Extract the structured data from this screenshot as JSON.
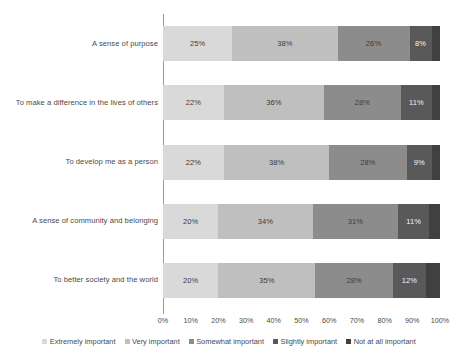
{
  "chart_data": {
    "type": "bar",
    "subtype": "horizontal-stacked-100",
    "title": "",
    "xlabel": "",
    "ylabel": "",
    "xlim": [
      0,
      100
    ],
    "grid": false,
    "legend_position": "bottom",
    "categories": [
      "A sense of purpose",
      "To make a difference in the lives of others",
      "To develop me as a person",
      "A sense of community and belonging",
      "To better society and the world"
    ],
    "series": [
      {
        "name": "Extremely important",
        "color": "#d9d9d9",
        "values": [
          25,
          22,
          22,
          20,
          20
        ],
        "labels": [
          "25%",
          "22%",
          "22%",
          "20%",
          "20%"
        ]
      },
      {
        "name": "Very important",
        "color": "#bfbfbf",
        "values": [
          38,
          36,
          38,
          34,
          35
        ],
        "labels": [
          "38%",
          "36%",
          "38%",
          "34%",
          "35%"
        ]
      },
      {
        "name": "Somewhat important",
        "color": "#8c8c8c",
        "values": [
          26,
          28,
          28,
          31,
          28
        ],
        "labels": [
          "26%",
          "28%",
          "28%",
          "31%",
          "28%"
        ]
      },
      {
        "name": "Slightly important",
        "color": "#595959",
        "values": [
          8,
          11,
          9,
          11,
          12
        ],
        "labels": [
          "8%",
          "11%",
          "9%",
          "11%",
          "12%"
        ]
      },
      {
        "name": "Not at all important",
        "color": "#404040",
        "values": [
          3,
          3,
          3,
          4,
          5
        ],
        "labels": [
          "",
          "",
          "",
          "",
          ""
        ]
      }
    ],
    "xticks": [
      "0%",
      "10%",
      "20%",
      "30%",
      "40%",
      "50%",
      "60%",
      "70%",
      "80%",
      "90%",
      "100%"
    ],
    "xtick_values": [
      0,
      10,
      20,
      30,
      40,
      50,
      60,
      70,
      80,
      90,
      100
    ]
  }
}
